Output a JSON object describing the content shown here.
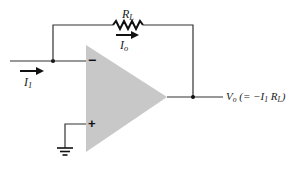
{
  "diagram": {
    "type": "inverting current-to-voltage op-amp circuit",
    "colors": {
      "wire": "#333333",
      "opamp_fill": "#c8c8c8",
      "background": "#ffffff"
    },
    "opamp": {
      "inverting_input_sign": "−",
      "noninverting_input_sign": "+"
    },
    "labels": {
      "resistor": {
        "main": "R",
        "sub": "L"
      },
      "feedback_current": {
        "main": "I",
        "sub": "o"
      },
      "input_current": {
        "main": "I",
        "sub": "1"
      },
      "output": {
        "v": "V",
        "v_sub": "o",
        "eq_open": " (= −I",
        "eq_sub1": "1",
        "eq_r": " R",
        "eq_sub2": "L",
        "eq_close": ")"
      }
    }
  }
}
